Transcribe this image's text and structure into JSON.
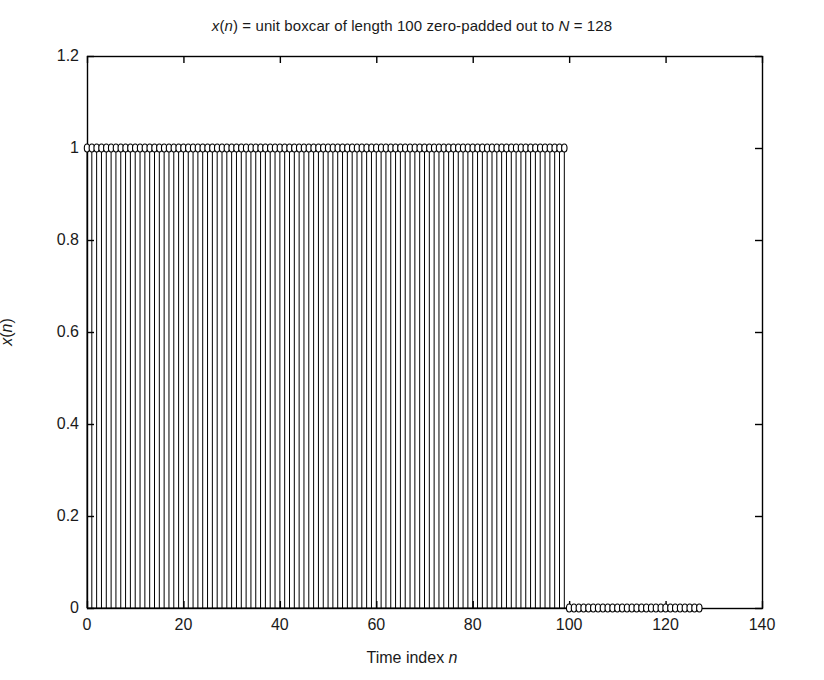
{
  "chart_data": {
    "type": "stem",
    "title": "x(n) = unit boxcar of length 100 zero-padded out to N = 128",
    "title_parts": {
      "pre": "",
      "x_italic": "x",
      "open_paren": "(",
      "n_italic": "n",
      "close_paren": ")",
      "mid": " = unit boxcar of length 100 zero-padded out to ",
      "N_italic": "N",
      "post": " = 128"
    },
    "xlabel": "Time index n",
    "xlabel_parts": {
      "text": "Time index ",
      "italic": "n"
    },
    "ylabel": "x(n)",
    "ylabel_parts": {
      "x_italic": "x",
      "open_paren": "(",
      "n_italic": "n",
      "close_paren": ")"
    },
    "xlim": [
      0,
      140
    ],
    "ylim": [
      0,
      1.2
    ],
    "xticks": [
      0,
      20,
      40,
      60,
      80,
      100,
      120,
      140
    ],
    "xticklabels": [
      "0",
      "20",
      "40",
      "60",
      "80",
      "100",
      "120",
      "140"
    ],
    "yticks": [
      0,
      0.2,
      0.4,
      0.6,
      0.8,
      1,
      1.2
    ],
    "yticklabels": [
      "0",
      "0.2",
      "0.4",
      "0.6",
      "0.8",
      "1",
      "1.2"
    ],
    "grid": false,
    "legend": null,
    "tick_direction": "in",
    "marker": "open-circle",
    "line_color": "#000000",
    "marker_face_color": "#ffffff",
    "marker_edge_color": "#000000",
    "boxcar_length": 100,
    "total_length_N": 128,
    "x": [
      0,
      1,
      2,
      3,
      4,
      5,
      6,
      7,
      8,
      9,
      10,
      11,
      12,
      13,
      14,
      15,
      16,
      17,
      18,
      19,
      20,
      21,
      22,
      23,
      24,
      25,
      26,
      27,
      28,
      29,
      30,
      31,
      32,
      33,
      34,
      35,
      36,
      37,
      38,
      39,
      40,
      41,
      42,
      43,
      44,
      45,
      46,
      47,
      48,
      49,
      50,
      51,
      52,
      53,
      54,
      55,
      56,
      57,
      58,
      59,
      60,
      61,
      62,
      63,
      64,
      65,
      66,
      67,
      68,
      69,
      70,
      71,
      72,
      73,
      74,
      75,
      76,
      77,
      78,
      79,
      80,
      81,
      82,
      83,
      84,
      85,
      86,
      87,
      88,
      89,
      90,
      91,
      92,
      93,
      94,
      95,
      96,
      97,
      98,
      99,
      100,
      101,
      102,
      103,
      104,
      105,
      106,
      107,
      108,
      109,
      110,
      111,
      112,
      113,
      114,
      115,
      116,
      117,
      118,
      119,
      120,
      121,
      122,
      123,
      124,
      125,
      126,
      127
    ],
    "values": [
      1,
      1,
      1,
      1,
      1,
      1,
      1,
      1,
      1,
      1,
      1,
      1,
      1,
      1,
      1,
      1,
      1,
      1,
      1,
      1,
      1,
      1,
      1,
      1,
      1,
      1,
      1,
      1,
      1,
      1,
      1,
      1,
      1,
      1,
      1,
      1,
      1,
      1,
      1,
      1,
      1,
      1,
      1,
      1,
      1,
      1,
      1,
      1,
      1,
      1,
      1,
      1,
      1,
      1,
      1,
      1,
      1,
      1,
      1,
      1,
      1,
      1,
      1,
      1,
      1,
      1,
      1,
      1,
      1,
      1,
      1,
      1,
      1,
      1,
      1,
      1,
      1,
      1,
      1,
      1,
      1,
      1,
      1,
      1,
      1,
      1,
      1,
      1,
      1,
      1,
      1,
      1,
      1,
      1,
      1,
      1,
      1,
      1,
      1,
      1,
      0,
      0,
      0,
      0,
      0,
      0,
      0,
      0,
      0,
      0,
      0,
      0,
      0,
      0,
      0,
      0,
      0,
      0,
      0,
      0,
      0,
      0,
      0,
      0,
      0,
      0,
      0,
      0
    ]
  },
  "axes_geometry": {
    "left_px": 87,
    "right_px": 762,
    "top_px": 56,
    "bottom_px": 608
  }
}
